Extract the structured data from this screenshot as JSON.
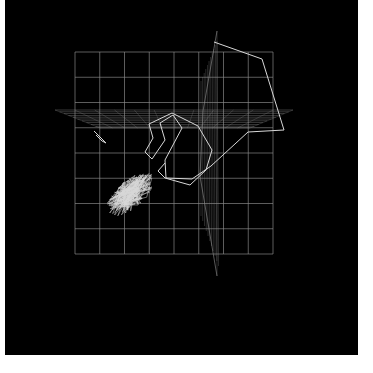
{
  "chart_data": {
    "type": "line",
    "title": "",
    "xlabel": "",
    "ylabel": "",
    "zlabel": "",
    "projection": "3d",
    "grid": true,
    "legend": null,
    "background_color": "#000000",
    "line_color": "#d8d8d8",
    "grid_color": "#8a8a8a",
    "grid_front_plane": {
      "x0": 75,
      "y0": 52,
      "x1": 273,
      "y1": 254,
      "cols": 8,
      "rows": 8
    },
    "horizontal_plane": {
      "left": [
        55,
        110
      ],
      "right": [
        293,
        110
      ],
      "back_left": [
        100,
        128
      ],
      "back_right": [
        250,
        128
      ]
    },
    "vertical_plane": {
      "top": [
        217,
        31
      ],
      "bottom": [
        217,
        276
      ]
    },
    "series": [
      {
        "name": "trajectory",
        "points": [
          [
            214,
            42
          ],
          [
            262,
            59
          ],
          [
            284,
            130
          ],
          [
            248,
            132
          ],
          [
            211,
            166
          ],
          [
            192,
            179
          ],
          [
            166,
            178
          ],
          [
            165,
            160
          ],
          [
            182,
            128
          ],
          [
            173,
            115
          ],
          [
            160,
            123
          ],
          [
            165,
            140
          ],
          [
            152,
            159
          ],
          [
            145,
            152
          ],
          [
            153,
            138
          ],
          [
            149,
            124
          ],
          [
            172,
            113
          ],
          [
            198,
            126
          ],
          [
            212,
            150
          ],
          [
            206,
            170
          ],
          [
            190,
            185
          ],
          [
            165,
            178
          ],
          [
            158,
            171
          ],
          [
            165,
            163
          ]
        ]
      },
      {
        "name": "dense-cluster",
        "center": [
          130,
          195
        ],
        "extent": [
          [
            100,
            160
          ],
          [
            165,
            230
          ]
        ]
      },
      {
        "name": "isolated-segment",
        "points": [
          [
            94,
            131
          ],
          [
            100,
            137
          ],
          [
            106,
            143
          ],
          [
            102,
            141
          ],
          [
            96,
            135
          ]
        ]
      }
    ]
  }
}
